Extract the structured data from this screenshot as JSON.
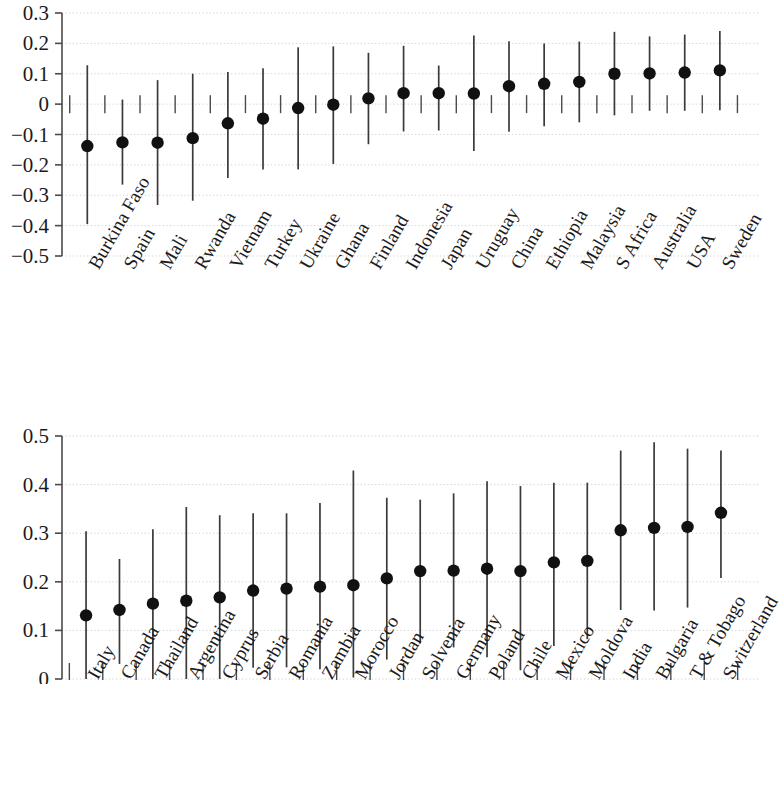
{
  "figure": {
    "background": "#ffffff",
    "marker_color": "#111111",
    "line_color": "#3a3a3a",
    "grid_color": "#cfcfcf"
  },
  "chart_data": [
    {
      "type": "scatter",
      "panel": "top",
      "title": "",
      "xlabel": "",
      "ylabel": "",
      "ylim": [
        -0.5,
        0.3
      ],
      "yticks": [
        0.3,
        0.2,
        0.1,
        0,
        -0.1,
        -0.2,
        -0.3,
        -0.4,
        -0.5
      ],
      "ytick_labels": [
        "0.3",
        "0.2",
        "0.1",
        "0",
        "−0.1",
        "−0.2",
        "−0.3",
        "−0.4",
        "−0.5"
      ],
      "grid": true,
      "legend": "none",
      "error_bars": true,
      "categories": [
        "Burkina Faso",
        "Spain",
        "Mali",
        "Rwanda",
        "Vietnam",
        "Turkey",
        "Ukraine",
        "Ghana",
        "Finland",
        "Indonesia",
        "Japan",
        "Uruguay",
        "China",
        "Ethiopia",
        "Malaysia",
        "S Africa",
        "Australia",
        "USA",
        "Sweden"
      ],
      "values": [
        -0.138,
        -0.126,
        -0.127,
        -0.112,
        -0.063,
        -0.048,
        -0.013,
        -0.002,
        0.019,
        0.036,
        0.036,
        0.035,
        0.059,
        0.067,
        0.073,
        0.1,
        0.101,
        0.104,
        0.111
      ],
      "ci_low": [
        -0.395,
        -0.265,
        -0.332,
        -0.318,
        -0.243,
        -0.215,
        -0.215,
        -0.197,
        -0.132,
        -0.09,
        -0.087,
        -0.154,
        -0.091,
        -0.073,
        -0.06,
        -0.037,
        -0.022,
        -0.022,
        -0.02
      ],
      "ci_high": [
        0.128,
        0.015,
        0.079,
        0.1,
        0.106,
        0.118,
        0.187,
        0.19,
        0.169,
        0.192,
        0.127,
        0.226,
        0.207,
        0.2,
        0.206,
        0.238,
        0.223,
        0.229,
        0.241
      ]
    },
    {
      "type": "scatter",
      "panel": "bottom",
      "title": "",
      "xlabel": "",
      "ylabel": "",
      "ylim": [
        0,
        0.5
      ],
      "yticks": [
        0.5,
        0.4,
        0.3,
        0.2,
        0.1,
        0
      ],
      "ytick_labels": [
        "0.5",
        "0.4",
        "0.3",
        "0.2",
        "0.1",
        "0"
      ],
      "grid": true,
      "legend": "none",
      "error_bars": true,
      "categories": [
        "Italy",
        "Canada",
        "Thailand",
        "Argentina",
        "Cyprus",
        "Serbia",
        "Romania",
        "Zambia",
        "Morocco",
        "Jordan",
        "Solvenia",
        "Germany",
        "Poland",
        "Chile",
        "Mexico",
        "Moldova",
        "India",
        "Bulgaria",
        "T & Tobago",
        "Switzerland"
      ],
      "values": [
        0.131,
        0.142,
        0.155,
        0.161,
        0.168,
        0.182,
        0.186,
        0.19,
        0.193,
        0.207,
        0.222,
        0.223,
        0.227,
        0.222,
        0.24,
        0.243,
        0.306,
        0.311,
        0.313,
        0.342
      ],
      "ci_low": [
        -0.005,
        0.031,
        -0.01,
        0.0,
        -0.001,
        0.023,
        0.024,
        0.02,
        0.003,
        0.04,
        0.073,
        0.065,
        0.045,
        0.018,
        0.068,
        0.082,
        0.142,
        0.141,
        0.147,
        0.208
      ],
      "ci_high": [
        0.304,
        0.247,
        0.308,
        0.354,
        0.337,
        0.341,
        0.341,
        0.362,
        0.429,
        0.373,
        0.369,
        0.382,
        0.407,
        0.397,
        0.404,
        0.404,
        0.47,
        0.487,
        0.474,
        0.47
      ]
    }
  ]
}
